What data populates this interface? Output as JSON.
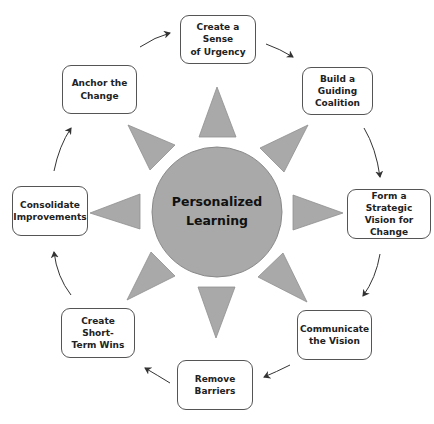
{
  "center": {
    "label_line1": "Personalized",
    "label_line2": "Learning",
    "fill": "#a9a9a9"
  },
  "steps": [
    {
      "id": 1,
      "line1": "Create a Sense",
      "line2": "of Urgency"
    },
    {
      "id": 2,
      "line1": "Build a Guiding",
      "line2": "Coalition"
    },
    {
      "id": 3,
      "line1": "Form a Strategic",
      "line2": "Vision for",
      "line3": "Change"
    },
    {
      "id": 4,
      "line1": "Communicate",
      "line2": "the Vision"
    },
    {
      "id": 5,
      "line1": "Remove",
      "line2": "Barriers"
    },
    {
      "id": 6,
      "line1": "Create Short-",
      "line2": "Term Wins"
    },
    {
      "id": 7,
      "line1": "Consolidate",
      "line2": "Improvements"
    },
    {
      "id": 8,
      "line1": "Anchor the",
      "line2": "Change"
    }
  ],
  "colors": {
    "triangle": "#a9a9a9",
    "outline": "#555555",
    "arrow": "#333333"
  }
}
